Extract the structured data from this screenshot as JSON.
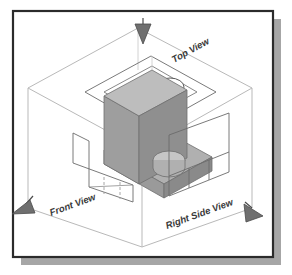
{
  "figure": {
    "frame": {
      "border_color": "#2b2b2b",
      "shadow_color": "#a6a6a6",
      "background": "#ffffff"
    },
    "glass_box": {
      "edge_color": "#b9b9b9",
      "hidden_edge_color": "#c9c9c9"
    },
    "object": {
      "name": "l-shaped-bracket-with-hole",
      "top_face_color": "#b5b5b5",
      "left_face_color": "#9a9a9a",
      "right_face_color": "#8c8c8c",
      "hole_color": "#c2c2c2",
      "outline_color": "#6e6e6e"
    },
    "projection_views": [
      {
        "id": "top-view",
        "label": "Top View",
        "plane": "horizontal-upper",
        "arrow_direction": "down",
        "features": "rectangular outline with circular hole"
      },
      {
        "id": "front-view",
        "label": "Front View",
        "plane": "frontal-left",
        "arrow_direction": "down-left",
        "features": "L-shaped profile with hidden dashed lines"
      },
      {
        "id": "right-side-view",
        "label": "Right Side View",
        "plane": "profile-right",
        "arrow_direction": "down-right",
        "features": "rectangle with vertical division lines"
      }
    ],
    "arrows": {
      "fill_color": "#6f6f6f",
      "stroke_color": "#4a4a4a",
      "count": 3
    },
    "line_styles": {
      "visible_color": "#555555",
      "hidden_color": "#9c9c9c",
      "hidden_dash": "3 2"
    }
  }
}
